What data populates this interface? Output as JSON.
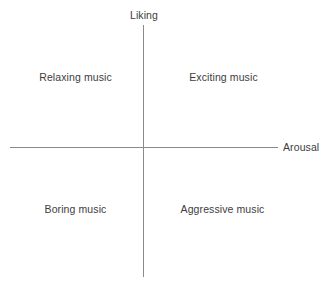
{
  "chart_data": {
    "type": "scatter",
    "title": "",
    "subtitle": "",
    "xlabel": "Arousal",
    "ylabel": "Liking",
    "grid": false,
    "legend": null,
    "axes": {
      "x": {
        "label": "Arousal",
        "label_position": "right-end",
        "ticks": [],
        "range": null
      },
      "y": {
        "label": "Liking",
        "label_position": "top-end",
        "ticks": [],
        "range": null
      }
    },
    "quadrant_labels": [
      {
        "id": "upper-left",
        "text": "Relaxing music",
        "arousal": "low",
        "liking": "high"
      },
      {
        "id": "upper-right",
        "text": "Exciting music",
        "arousal": "high",
        "liking": "high"
      },
      {
        "id": "lower-left",
        "text": "Boring music",
        "arousal": "low",
        "liking": "low"
      },
      {
        "id": "lower-right",
        "text": "Aggressive music",
        "arousal": "high",
        "liking": "low"
      }
    ],
    "annotations": [],
    "values": [],
    "colors": {
      "axis_line": "#8a8a8a",
      "text": "#3d3d3d",
      "background": "#ffffff"
    }
  },
  "diagram": {
    "axis_y_label": "Liking",
    "axis_x_label": "Arousal",
    "quadrants": {
      "upper_left": "Relaxing music",
      "upper_right": "Exciting music",
      "lower_left": "Boring music",
      "lower_right": "Aggressive music"
    }
  }
}
